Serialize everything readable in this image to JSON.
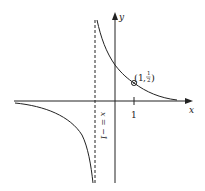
{
  "figure": {
    "type": "function-graph",
    "function": "y = 1/(x+1)",
    "axes": {
      "x_label": "x",
      "y_label": "y"
    },
    "ticks": {
      "x": [
        {
          "value": 1,
          "label": "1"
        }
      ]
    },
    "asymptote": {
      "label": "x = −1",
      "style": "dashed",
      "orientation": "vertical"
    },
    "point": {
      "label_x": "1",
      "label_y_num": "1",
      "label_y_den": "2",
      "label_open": "(",
      "label_sep": ",",
      "label_close": ")"
    },
    "colors": {
      "stroke": "#222222",
      "background": "#ffffff"
    }
  }
}
